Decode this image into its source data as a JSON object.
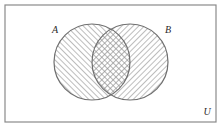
{
  "figure": {
    "type": "venn-diagram",
    "title": "",
    "background_color": "#ffffff",
    "stroke_color": "#7a7a7a",
    "hatch_color": "#8c8c8c",
    "label_color": "#2b2b2b"
  },
  "universe": {
    "label": "U",
    "shape": "rectangle",
    "border_color": "#8a8a8a",
    "fill": "#ffffff",
    "label_position": "bottom-right"
  },
  "sets": [
    {
      "id": "A",
      "label": "A",
      "shape": "circle",
      "cx": 92,
      "cy": 62,
      "r": 38,
      "hatch": "forward-slash",
      "label_x": 55,
      "label_y": 33,
      "shaded": true
    },
    {
      "id": "B",
      "label": "B",
      "shape": "circle",
      "cx": 130,
      "cy": 62,
      "r": 38,
      "hatch": "back-slash",
      "label_x": 168,
      "label_y": 33,
      "shaded": true
    }
  ],
  "intersection": {
    "id": "A-and-B",
    "hatch": "cross-hatch",
    "shaded": true
  }
}
